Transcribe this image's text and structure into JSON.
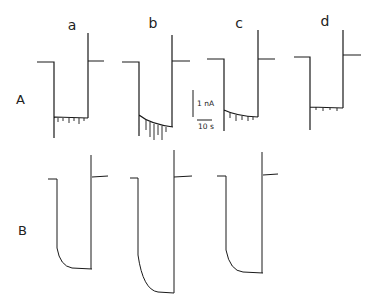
{
  "figure": {
    "row_labels": [
      {
        "id": "A",
        "text": "A",
        "x": 16,
        "y": 104
      },
      {
        "id": "B",
        "text": "B",
        "x": 18,
        "y": 235
      }
    ],
    "column_labels": [
      {
        "id": "a",
        "text": "a",
        "x": 72,
        "y": 30
      },
      {
        "id": "b",
        "text": "b",
        "x": 153,
        "y": 28
      },
      {
        "id": "c",
        "text": "c",
        "x": 239,
        "y": 28
      },
      {
        "id": "d",
        "text": "d",
        "x": 325,
        "y": 26
      }
    ],
    "scale_bar": {
      "current_label": "1 nA",
      "time_label": "10 s"
    },
    "trace_color": "#1a1a1a",
    "traces": [
      {
        "row": "A",
        "col": "a",
        "path": "M37 62 L54 62 L54 138 M54 118 L55 117 L88 118 M88 33 L88 118 M88 61 L104 61"
      },
      {
        "row": "A",
        "col": "b",
        "path": "M122 62 L139 62 L139 136 M139 115 Q150 124 173 127 M172 35 L172 127 M172 61 L190 61"
      },
      {
        "row": "A",
        "col": "c",
        "path": "M207 59 L224 59 L224 131 M224 110 Q236 116 258 117 M258 30 L258 117 M258 59 L275 59"
      },
      {
        "row": "A",
        "col": "d",
        "path": "M294 57 L310 57 L310 130 M310 107 L343 108 M343 30 L343 108 M343 55 L361 55"
      },
      {
        "row": "B",
        "col": "a",
        "path": "M48 179 L57 179 L57 248 Q60 266 72 268 L92 269 M91 155 L91 269 M92 177 L108 176"
      },
      {
        "row": "B",
        "col": "b",
        "path": "M130 178 L138 178 L138 255 Q143 290 158 292 L174 293 M174 150 L174 293 M174 177 L192 176"
      },
      {
        "row": "B",
        "col": "c",
        "path": "M217 176 L226 176 L226 250 Q230 271 243 272 L263 273 M262 152 L262 273 M263 175 L278 174"
      }
    ],
    "noise": [
      {
        "row": "A",
        "col": "a",
        "path": "M58 118 L58 122 M63 118 L63 121 M69 118 L69 123 M74 118 L74 121 M79 118 L79 124 M84 118 L84 121"
      },
      {
        "row": "A",
        "col": "b",
        "path": "M146 120 L146 130 M150 122 L150 137 M154 124 L154 140 M158 125 L158 135 M162 126 L162 140 M166 127 L166 132"
      },
      {
        "row": "A",
        "col": "c",
        "path": "M230 113 L230 118 M236 115 L236 121 M242 116 L242 120 M248 116 L248 121 M253 117 L253 120"
      },
      {
        "row": "A",
        "col": "d",
        "path": "M316 107 L316 110 M323 108 L323 111 M330 108 L330 110 M337 108 L337 111"
      }
    ]
  }
}
